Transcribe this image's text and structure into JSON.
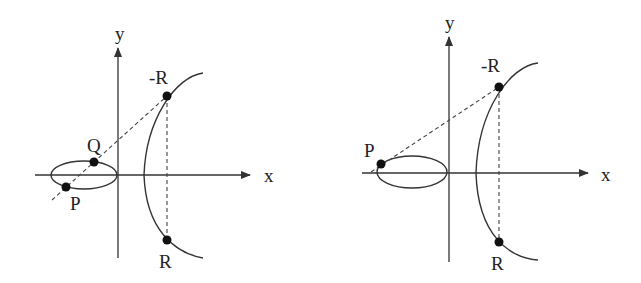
{
  "panels": [
    {
      "id": "left",
      "axes": {
        "x_label": "x",
        "y_label": "y"
      },
      "points": {
        "P": "P",
        "Q": "Q",
        "neg_R": "-R",
        "R": "R"
      },
      "description": "Point addition P + Q = R on an elliptic curve"
    },
    {
      "id": "right",
      "axes": {
        "x_label": "x",
        "y_label": "y"
      },
      "points": {
        "P": "P",
        "neg_R": "-R",
        "R": "R"
      },
      "description": "Point doubling P + P = R on an elliptic curve (tangent at P)"
    }
  ],
  "colors": {
    "stroke": "#333333",
    "point": "#111111",
    "background": "#ffffff"
  }
}
